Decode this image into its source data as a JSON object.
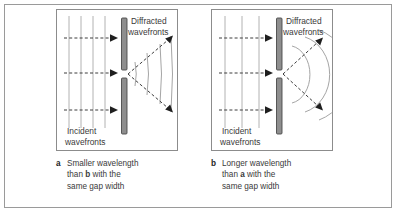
{
  "figure": {
    "border_color": "#9a9a9a",
    "background_color": "#ffffff"
  },
  "panels": [
    {
      "id": "panel-a",
      "letter": "a",
      "wavelength_type": "smaller",
      "incident_label_line1": "Incident",
      "incident_label_line2": "wavefronts",
      "diffracted_label_line1": "Diffracted",
      "diffracted_label_line2": "wavefronts",
      "incident_wavefront_count": 4,
      "incident_arrow_count": 3,
      "diffracted_wavefront_count": 3,
      "diffracted_arrow_count": 2,
      "diffracted_shape": "nearly-straight",
      "spread_angle_degrees": 14,
      "caption": {
        "line1": "Smaller wavelength",
        "line2_pre": "than ",
        "line2_bold": "b",
        "line2_post": " with the",
        "line3": "same gap width"
      }
    },
    {
      "id": "panel-b",
      "letter": "b",
      "wavelength_type": "longer",
      "incident_label_line1": "Incident",
      "incident_label_line2": "wavefronts",
      "diffracted_label_line1": "Diffracted",
      "diffracted_label_line2": "wavefronts",
      "incident_wavefront_count": 3,
      "incident_arrow_count": 3,
      "diffracted_wavefront_count": 3,
      "diffracted_arrow_count": 2,
      "diffracted_shape": "curved-arcs",
      "spread_angle_degrees": 34,
      "caption": {
        "line1": "Longer wavelength",
        "line2_pre": "than ",
        "line2_bold": "a",
        "line2_post": " with the",
        "line3": "same gap width"
      }
    }
  ],
  "colors": {
    "wavefront_line": "#b2b2b2",
    "arc_line": "#a5a5a5",
    "ray_dashed": "#3d3d3d",
    "barrier_fill": "#8e8e8e",
    "barrier_stroke": "#4a4a4a",
    "label_text": "#3a3a3a",
    "caption_letter": "#1d1d1d"
  }
}
